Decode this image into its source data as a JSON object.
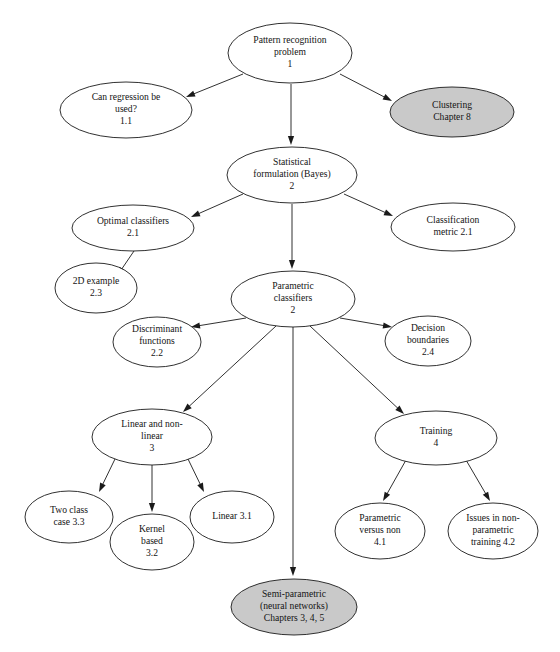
{
  "diagram": {
    "colors": {
      "background": "#ffffff",
      "node_fill": "#ffffff",
      "node_shaded_fill": "#c9c9c9",
      "stroke": "#1a1a1a",
      "text": "#141414"
    },
    "nodes": [
      {
        "id": "pattern-recognition-problem",
        "lines": [
          "Pattern recognition",
          "problem",
          "1"
        ],
        "cx": 290,
        "cy": 53,
        "rx": 62,
        "ry": 30,
        "shaded": false
      },
      {
        "id": "can-regression-be-used",
        "lines": [
          "Can regression be",
          "used?",
          "1.1"
        ],
        "cx": 126,
        "cy": 110,
        "rx": 66,
        "ry": 28,
        "shaded": false
      },
      {
        "id": "clustering-chapter-8",
        "lines": [
          "Clustering",
          "Chapter 8"
        ],
        "cx": 452,
        "cy": 112,
        "rx": 62,
        "ry": 25,
        "shaded": true
      },
      {
        "id": "statistical-formulation-bayes",
        "lines": [
          "Statistical",
          "formulation (Bayes)",
          "2"
        ],
        "cx": 292,
        "cy": 175,
        "rx": 65,
        "ry": 28,
        "shaded": false
      },
      {
        "id": "optimal-classifiers",
        "lines": [
          "Optimal classifiers",
          "2.1"
        ],
        "cx": 133,
        "cy": 228,
        "rx": 61,
        "ry": 23,
        "shaded": false
      },
      {
        "id": "classification-metric",
        "lines": [
          "Classification",
          "metric 2.1"
        ],
        "cx": 453,
        "cy": 227,
        "rx": 62,
        "ry": 24,
        "shaded": false
      },
      {
        "id": "2d-example",
        "lines": [
          "2D example",
          "2.3"
        ],
        "cx": 96,
        "cy": 288,
        "rx": 41,
        "ry": 25,
        "shaded": false
      },
      {
        "id": "parametric-classifiers",
        "lines": [
          "Parametric",
          "classifiers",
          "2"
        ],
        "cx": 293,
        "cy": 299,
        "rx": 62,
        "ry": 28,
        "shaded": false
      },
      {
        "id": "discriminant-functions",
        "lines": [
          "Discriminant",
          "functions",
          "2.2"
        ],
        "cx": 157,
        "cy": 342,
        "rx": 44,
        "ry": 25,
        "shaded": false
      },
      {
        "id": "decision-boundaries",
        "lines": [
          "Decision",
          "boundaries",
          "2.4"
        ],
        "cx": 428,
        "cy": 341,
        "rx": 43,
        "ry": 25,
        "shaded": false
      },
      {
        "id": "linear-and-non-linear",
        "lines": [
          "Linear and non-",
          "linear",
          "3"
        ],
        "cx": 152,
        "cy": 437,
        "rx": 60,
        "ry": 28,
        "shaded": false
      },
      {
        "id": "training",
        "lines": [
          "Training",
          "4"
        ],
        "cx": 436,
        "cy": 438,
        "rx": 61,
        "ry": 27,
        "shaded": false
      },
      {
        "id": "two-class-case",
        "lines": [
          "Two class",
          "case 3.3"
        ],
        "cx": 69,
        "cy": 517,
        "rx": 44,
        "ry": 26,
        "shaded": false
      },
      {
        "id": "kernel-based",
        "lines": [
          "Kernel",
          "based",
          "3.2"
        ],
        "cx": 152,
        "cy": 542,
        "rx": 42,
        "ry": 28,
        "shaded": false
      },
      {
        "id": "linear-3-1",
        "lines": [
          "Linear 3.1"
        ],
        "cx": 232,
        "cy": 517,
        "rx": 42,
        "ry": 26,
        "shaded": false
      },
      {
        "id": "parametric-versus-non",
        "lines": [
          "Parametric",
          "versus non",
          "4.1"
        ],
        "cx": 380,
        "cy": 531,
        "rx": 45,
        "ry": 28,
        "shaded": false
      },
      {
        "id": "issues-in-non-parametric-training",
        "lines": [
          "Issues in non-",
          "parametric",
          "training 4.2"
        ],
        "cx": 493,
        "cy": 531,
        "rx": 45,
        "ry": 28,
        "shaded": false
      },
      {
        "id": "semi-parametric-neural-networks",
        "lines": [
          "Semi-parametric",
          "(neural networks)",
          "Chapters 3, 4, 5"
        ],
        "cx": 294,
        "cy": 607,
        "rx": 63,
        "ry": 28,
        "shaded": true
      }
    ],
    "edges": [
      {
        "id": "edge-problem-to-regression",
        "from": "pattern-recognition-problem",
        "to": "can-regression-be-used",
        "x1": 243,
        "y1": 74,
        "x2": 186,
        "y2": 97
      },
      {
        "id": "edge-problem-to-clustering",
        "from": "pattern-recognition-problem",
        "to": "clustering-chapter-8",
        "x1": 340,
        "y1": 74,
        "x2": 392,
        "y2": 101
      },
      {
        "id": "edge-problem-to-statistical",
        "from": "pattern-recognition-problem",
        "to": "statistical-formulation-bayes",
        "x1": 291,
        "y1": 84,
        "x2": 291,
        "y2": 145
      },
      {
        "id": "edge-statistical-to-optimal",
        "from": "statistical-formulation-bayes",
        "to": "optimal-classifiers",
        "x1": 243,
        "y1": 194,
        "x2": 191,
        "y2": 217
      },
      {
        "id": "edge-statistical-to-metric",
        "from": "statistical-formulation-bayes",
        "to": "classification-metric",
        "x1": 344,
        "y1": 194,
        "x2": 393,
        "y2": 216
      },
      {
        "id": "edge-statistical-to-parametric",
        "from": "statistical-formulation-bayes",
        "to": "parametric-classifiers",
        "x1": 292,
        "y1": 204,
        "x2": 292,
        "y2": 269
      },
      {
        "id": "edge-optimal-to-2d-example",
        "from": "optimal-classifiers",
        "to": "2d-example",
        "x1": 134,
        "y1": 251,
        "x2": 117,
        "y2": 276
      },
      {
        "id": "edge-parametric-to-discriminant",
        "from": "parametric-classifiers",
        "to": "discriminant-functions",
        "x1": 246,
        "y1": 318,
        "x2": 191,
        "y2": 327
      },
      {
        "id": "edge-parametric-to-decision",
        "from": "parametric-classifiers",
        "to": "decision-boundaries",
        "x1": 340,
        "y1": 318,
        "x2": 392,
        "y2": 327
      },
      {
        "id": "edge-parametric-to-linear-nonlinear",
        "from": "parametric-classifiers",
        "to": "linear-and-non-linear",
        "x1": 276,
        "y1": 326,
        "x2": 183,
        "y2": 412
      },
      {
        "id": "edge-parametric-to-training",
        "from": "parametric-classifiers",
        "to": "training",
        "x1": 310,
        "y1": 326,
        "x2": 404,
        "y2": 414
      },
      {
        "id": "edge-parametric-to-semi-parametric",
        "from": "parametric-classifiers",
        "to": "semi-parametric-neural-networks",
        "x1": 293,
        "y1": 327,
        "x2": 293,
        "y2": 576
      },
      {
        "id": "edge-linear-to-two-class",
        "from": "linear-and-non-linear",
        "to": "two-class-case",
        "x1": 115,
        "y1": 459,
        "x2": 99,
        "y2": 492
      },
      {
        "id": "edge-linear-to-kernel",
        "from": "linear-and-non-linear",
        "to": "kernel-based",
        "x1": 152,
        "y1": 465,
        "x2": 152,
        "y2": 512
      },
      {
        "id": "edge-linear-to-linear31",
        "from": "linear-and-non-linear",
        "to": "linear-3-1",
        "x1": 188,
        "y1": 459,
        "x2": 204,
        "y2": 492
      },
      {
        "id": "edge-training-to-parametric-versus-non",
        "from": "training",
        "to": "parametric-versus-non",
        "x1": 406,
        "y1": 460,
        "x2": 383,
        "y2": 501
      },
      {
        "id": "edge-training-to-issues-non-parametric",
        "from": "training",
        "to": "issues-in-non-parametric-training",
        "x1": 466,
        "y1": 460,
        "x2": 490,
        "y2": 501
      }
    ]
  }
}
